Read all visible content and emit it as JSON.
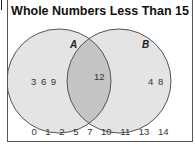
{
  "title": "Whole Numbers Less Than 15",
  "sets": {
    "A": {
      "label": "A",
      "only": "3  6  9"
    },
    "B": {
      "label": "B",
      "only": "4  8"
    },
    "intersection": "12"
  },
  "outside": [
    "0",
    "1",
    "2",
    "5",
    "7",
    "10",
    "11",
    "13",
    "14"
  ],
  "colors": {
    "circle_fill": "#e4e4e4",
    "overlap_fill": "#c4c4c4",
    "stroke": "#555555"
  }
}
